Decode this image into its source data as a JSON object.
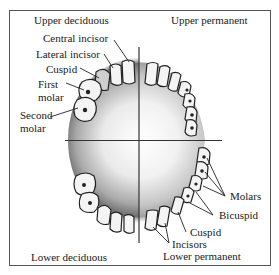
{
  "diagram": {
    "quadrants": {
      "upper_left": "Upper deciduous",
      "upper_right": "Upper permanent",
      "lower_left": "Lower deciduous",
      "lower_right": "Lower permanent"
    },
    "deciduous_labels": {
      "central_incisor": "Central incisor",
      "lateral_incisor": "Lateral incisor",
      "cuspid": "Cuspid",
      "first_molar_1": "First",
      "first_molar_2": "molar",
      "second_molar_1": "Second",
      "second_molar_2": "molar"
    },
    "permanent_labels": {
      "molars": "Molars",
      "bicuspid": "Bicuspid",
      "cuspid": "Cuspid",
      "incisors": "Incisors"
    },
    "colors": {
      "line": "#333333",
      "tooth_fill": "#f4f4f4",
      "tooth_outline": "#222222",
      "shadow": "#7a7a7a"
    }
  }
}
